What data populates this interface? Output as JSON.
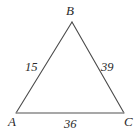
{
  "figure": {
    "type": "triangle-diagram",
    "background": "#ffffff",
    "stroke_color": "#4a4a4a",
    "base_stroke_color": "#8a8a8a",
    "label_color": "#2b2b2b",
    "vertices": {
      "A": {
        "label": "A",
        "x": 16,
        "y": 113
      },
      "B": {
        "label": "B",
        "x": 72,
        "y": 22
      },
      "C": {
        "label": "C",
        "x": 124,
        "y": 113
      }
    },
    "sides": [
      {
        "name": "AB",
        "label": "15",
        "from": "A",
        "to": "B"
      },
      {
        "name": "BC",
        "label": "39",
        "from": "B",
        "to": "C"
      },
      {
        "name": "AC",
        "label": "36",
        "from": "A",
        "to": "C"
      }
    ]
  },
  "chart_data": {
    "type": "diagram",
    "title": "",
    "shape": "triangle",
    "vertex_labels": [
      "A",
      "B",
      "C"
    ],
    "side_lengths": [
      {
        "side": "AB",
        "value": 15
      },
      {
        "side": "BC",
        "value": 39
      },
      {
        "side": "AC",
        "value": 36
      }
    ],
    "annotations": [
      "15",
      "39",
      "36",
      "A",
      "B",
      "C"
    ]
  }
}
